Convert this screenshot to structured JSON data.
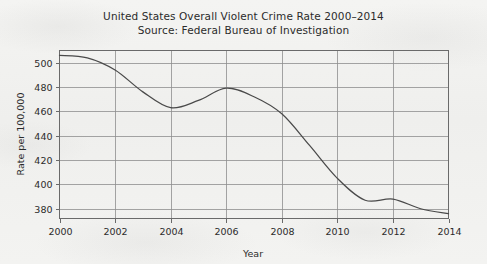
{
  "chart_data": {
    "type": "line",
    "title": "United States Overall Violent Crime Rate 2000–2014",
    "subtitle": "Source: Federal Bureau of Investigation",
    "xlabel": "Year",
    "ylabel": "Rate per 100,000",
    "xlim": [
      2000,
      2014
    ],
    "ylim": [
      372,
      510
    ],
    "grid": true,
    "legend": false,
    "x_ticks": [
      2000,
      2002,
      2004,
      2006,
      2008,
      2010,
      2012,
      2014
    ],
    "x_tick_labels": [
      "2000",
      "2002",
      "2004",
      "2006",
      "2008",
      "2010",
      "2012",
      "2014"
    ],
    "y_ticks": [
      380,
      400,
      420,
      440,
      460,
      480,
      500
    ],
    "y_tick_labels": [
      "380",
      "400",
      "420",
      "440",
      "460",
      "480",
      "500"
    ],
    "x": [
      2000,
      2001,
      2002,
      2003,
      2004,
      2005,
      2006,
      2007,
      2008,
      2009,
      2010,
      2011,
      2012,
      2013,
      2014
    ],
    "values": [
      506,
      504,
      494,
      476,
      463,
      469,
      479,
      472,
      458,
      432,
      405,
      387,
      388,
      380,
      376
    ],
    "series": [
      {
        "name": "Violent crime rate",
        "color": "#4a4a4a",
        "values": [
          506,
          504,
          494,
          476,
          463,
          469,
          479,
          472,
          458,
          432,
          405,
          387,
          388,
          380,
          376
        ]
      }
    ]
  },
  "figure": {
    "title_line1": "United States Overall Violent Crime Rate 2000–2014",
    "title_line2": "Source: Federal Bureau of Investigation",
    "x_axis_title": "Year",
    "y_axis_title": "Rate per 100,000"
  }
}
